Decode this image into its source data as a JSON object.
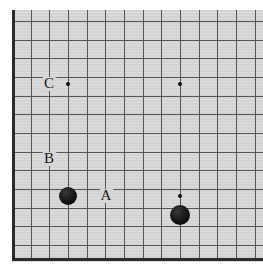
{
  "figure": {
    "type": "go-board-diagram",
    "board_size": 19,
    "board_background_color": "#d6d6d6",
    "line_color": "#555555",
    "border_color": "#2a2a2a",
    "stone_color": "#000000",
    "label_color": "#1a1a1a"
  },
  "grid": {
    "origin_x": 12,
    "origin_y": 21,
    "spacing": 18.67,
    "vertical_line_count": 14,
    "horizontal_line_count": 13,
    "edge_left_x": 12,
    "edge_bottom_y": 259,
    "edge_thickness": 3
  },
  "hoshi_points": [
    {
      "name": "hoshi-upper-left",
      "x": 68,
      "y": 84,
      "radius": 2.4
    },
    {
      "name": "hoshi-upper-right",
      "x": 180,
      "y": 84,
      "radius": 2.4
    },
    {
      "name": "hoshi-lower-right",
      "x": 180,
      "y": 196,
      "radius": 2.4
    }
  ],
  "stones": [
    {
      "name": "black-stone-1",
      "color": "black",
      "x": 68,
      "y": 196,
      "radius": 9
    },
    {
      "name": "black-stone-2",
      "color": "black",
      "x": 180,
      "y": 215,
      "radius": 10
    }
  ],
  "labels": [
    {
      "id": "label-a",
      "text": "A",
      "x": 106,
      "y": 196
    },
    {
      "id": "label-b",
      "text": "B",
      "x": 49,
      "y": 159
    },
    {
      "id": "label-c",
      "text": "C",
      "x": 49,
      "y": 84
    }
  ]
}
